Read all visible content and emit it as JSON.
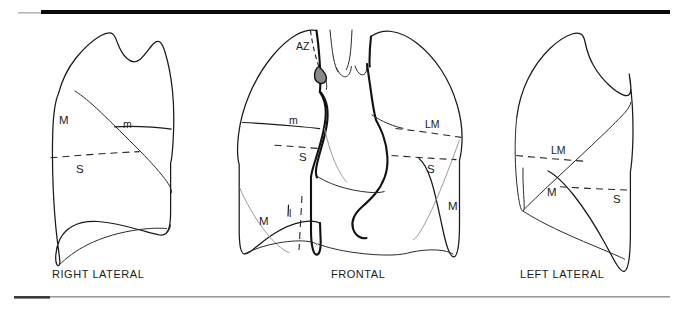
{
  "figure": {
    "ink_color": "#1a1a1a",
    "background_color": "#ffffff",
    "rule_color": "#0a0a0a"
  },
  "panels": [
    {
      "id": "right-lateral",
      "caption": "RIGHT LATERAL",
      "labels": [
        {
          "key": "major",
          "text": "M"
        },
        {
          "key": "minor",
          "text": "m"
        },
        {
          "key": "superior",
          "text": "S"
        }
      ]
    },
    {
      "id": "frontal",
      "caption": "FRONTAL",
      "labels": [
        {
          "key": "azygos",
          "text": "AZ"
        },
        {
          "key": "minor-right",
          "text": "m"
        },
        {
          "key": "superior-right",
          "text": "S"
        },
        {
          "key": "major-right",
          "text": "M"
        },
        {
          "key": "lower-right",
          "text": "l"
        },
        {
          "key": "lingula-left",
          "text": "LM"
        },
        {
          "key": "superior-left",
          "text": "S"
        },
        {
          "key": "major-left",
          "text": "M"
        }
      ]
    },
    {
      "id": "left-lateral",
      "caption": "LEFT LATERAL",
      "labels": [
        {
          "key": "lingula",
          "text": "LM"
        },
        {
          "key": "superior",
          "text": "S"
        },
        {
          "key": "major",
          "text": "M"
        }
      ]
    }
  ],
  "captions": {
    "right_lateral": "RIGHT LATERAL",
    "frontal": "FRONTAL",
    "left_lateral": "LEFT LATERAL"
  },
  "annotations": {
    "rl_major": "M",
    "rl_minor": "m",
    "rl_superior": "S",
    "fr_azygos": "AZ",
    "fr_minor_right": "m",
    "fr_superior_right": "S",
    "fr_major_right": "M",
    "fr_lower_right": "l",
    "fr_lingula_left": "LM",
    "fr_superior_left": "S",
    "fr_major_left": "M",
    "ll_lingula": "LM",
    "ll_superior": "S",
    "ll_major": "M"
  }
}
